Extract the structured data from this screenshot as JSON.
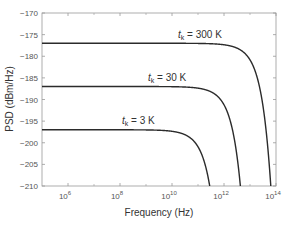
{
  "chart_data": {
    "type": "line",
    "title": "",
    "xlabel": "Frequency (Hz)",
    "ylabel": "PSD (dBm/Hz)",
    "xscale": "log",
    "xlim": [
      100000,
      100000000000000
    ],
    "ylim": [
      -210,
      -170
    ],
    "x_ticks": [
      {
        "exp": 6,
        "label_base": "10",
        "label_exp": "6"
      },
      {
        "exp": 8,
        "label_base": "10",
        "label_exp": "8"
      },
      {
        "exp": 10,
        "label_base": "10",
        "label_exp": "10"
      },
      {
        "exp": 12,
        "label_base": "10",
        "label_exp": "12"
      },
      {
        "exp": 14,
        "label_base": "10",
        "label_exp": "14"
      }
    ],
    "x_minor_ticks_exp": [
      7,
      9,
      11,
      13
    ],
    "y_ticks": [
      -170,
      -175,
      -180,
      -185,
      -190,
      -195,
      -200,
      -205,
      -210
    ],
    "grid": false,
    "legend": null,
    "series": [
      {
        "name": "t_k = 300 K",
        "label_var": "t",
        "label_sub": "k",
        "label_text": " = 300 K",
        "plateau_dbm_hz": -177,
        "cutoff_log10_hz": 13.8,
        "label_x": 178,
        "label_y": 38
      },
      {
        "name": "t_k = 30 K",
        "label_var": "t",
        "label_sub": "k",
        "label_text": " = 30 K",
        "plateau_dbm_hz": -187,
        "cutoff_log10_hz": 12.63,
        "label_x": 148,
        "label_y": 81
      },
      {
        "name": "t_k = 3 K",
        "label_var": "t",
        "label_sub": "k",
        "label_text": " = 3 K",
        "plateau_dbm_hz": -197,
        "cutoff_log10_hz": 11.45,
        "label_x": 122,
        "label_y": 124
      }
    ]
  },
  "colors": {
    "curve": "#2b2b2b",
    "axis": "#999999",
    "text": "#555555"
  }
}
